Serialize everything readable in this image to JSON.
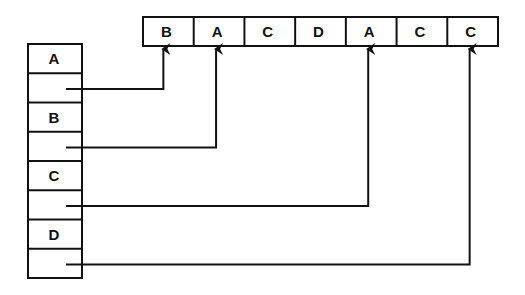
{
  "top_array": {
    "cells": [
      "B",
      "A",
      "C",
      "D",
      "A",
      "C",
      "C"
    ]
  },
  "left_table": {
    "rows": [
      {
        "label": "A",
        "points_to_index": 0
      },
      {
        "label": "B",
        "points_to_index": 1
      },
      {
        "label": "C",
        "points_to_index": 4
      },
      {
        "label": "D",
        "points_to_index": 6
      }
    ]
  },
  "colors": {
    "stroke": "#111111",
    "background": "#ffffff"
  }
}
